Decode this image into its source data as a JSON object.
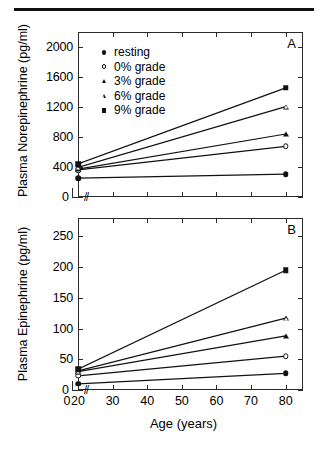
{
  "figure": {
    "panels": [
      {
        "letter": "A",
        "ylabel": "Plasma Norepinephrine (pg/ml)",
        "yticks": [
          "400",
          "800",
          "1200",
          "1600",
          "2000"
        ],
        "origin_label": "0",
        "break_symbol": "//"
      },
      {
        "letter": "B",
        "ylabel": "Plasma Epinephrine (pg/ml)",
        "yticks": [
          "50",
          "100",
          "150",
          "200",
          "250"
        ],
        "origin_label": "0",
        "break_symbol": "//"
      }
    ],
    "xlabel": "Age (years)",
    "xticks": [
      "0",
      "20",
      "30",
      "40",
      "50",
      "60",
      "70",
      "80"
    ]
  },
  "legend": {
    "position": "top-left-panel-A",
    "items": [
      {
        "label": "resting",
        "marker": "circle-filled"
      },
      {
        "label": "0% grade",
        "marker": "circle-open"
      },
      {
        "label": "3% grade",
        "marker": "tri-filled"
      },
      {
        "label": "6% grade",
        "marker": "tri-open"
      },
      {
        "label": "9% grade",
        "marker": "square-filled"
      }
    ]
  },
  "chart_data": [
    {
      "type": "line",
      "panel": "A",
      "title": "",
      "xlabel": "Age (years)",
      "ylabel": "Plasma Norepinephrine (pg/ml)",
      "x": [
        20,
        80
      ],
      "xlim": [
        20,
        85
      ],
      "ylim": [
        0,
        2200
      ],
      "yticks": [
        0,
        400,
        800,
        1200,
        1600,
        2000
      ],
      "xticks": [
        20,
        30,
        40,
        50,
        60,
        70,
        80
      ],
      "axis_break": true,
      "grid": false,
      "legend_position": "upper left",
      "series": [
        {
          "name": "resting",
          "marker": "circle-filled",
          "values": [
            250,
            305
          ]
        },
        {
          "name": "0% grade",
          "marker": "circle-open",
          "values": [
            360,
            675
          ]
        },
        {
          "name": "3% grade",
          "marker": "tri-filled",
          "values": [
            370,
            840
          ]
        },
        {
          "name": "6% grade",
          "marker": "tri-open",
          "values": [
            395,
            1205
          ]
        },
        {
          "name": "9% grade",
          "marker": "square-filled",
          "values": [
            440,
            1455
          ]
        }
      ]
    },
    {
      "type": "line",
      "panel": "B",
      "title": "",
      "xlabel": "Age (years)",
      "ylabel": "Plasma Epinephrine (pg/ml)",
      "x": [
        20,
        80
      ],
      "xlim": [
        20,
        85
      ],
      "ylim": [
        0,
        280
      ],
      "yticks": [
        0,
        50,
        100,
        150,
        200,
        250
      ],
      "xticks": [
        20,
        30,
        40,
        50,
        60,
        70,
        80
      ],
      "axis_break": true,
      "grid": false,
      "legend_position": "none",
      "series": [
        {
          "name": "resting",
          "marker": "circle-filled",
          "values": [
            10,
            27
          ]
        },
        {
          "name": "0% grade",
          "marker": "circle-open",
          "values": [
            23,
            55
          ]
        },
        {
          "name": "3% grade",
          "marker": "tri-filled",
          "values": [
            30,
            88
          ]
        },
        {
          "name": "6% grade",
          "marker": "tri-open",
          "values": [
            31,
            117
          ]
        },
        {
          "name": "9% grade",
          "marker": "square-filled",
          "values": [
            34,
            195
          ]
        }
      ]
    }
  ]
}
